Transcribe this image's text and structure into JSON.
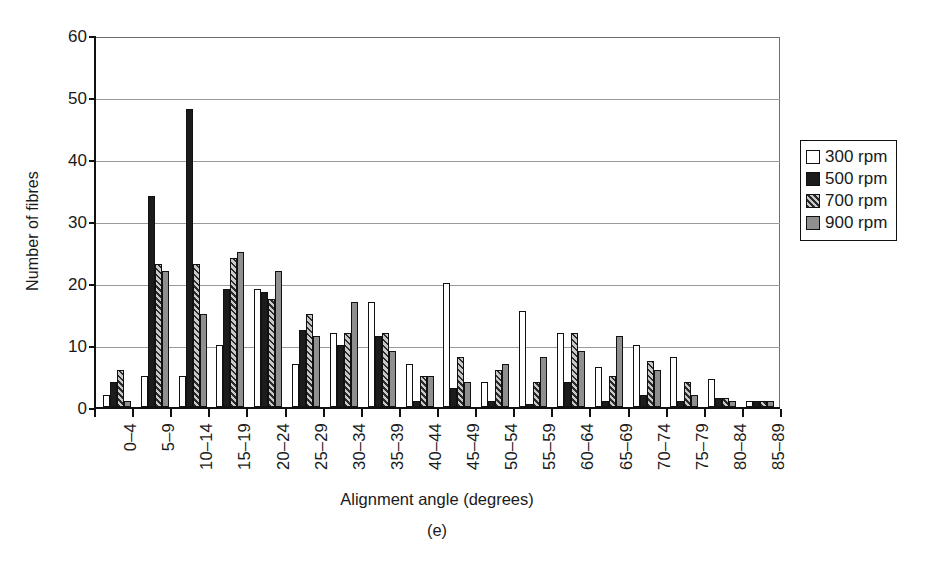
{
  "chart_data": {
    "type": "bar",
    "title": "",
    "panel_label": "(e)",
    "xlabel": "Alignment angle (degrees)",
    "ylabel": "Number of fibres",
    "ylim": [
      0,
      60
    ],
    "yticks": [
      0,
      10,
      20,
      30,
      40,
      50,
      60
    ],
    "grid": "horizontal",
    "legend_position": "right",
    "categories": [
      "0–4",
      "5–9",
      "10–14",
      "15–19",
      "20–24",
      "25–29",
      "30–34",
      "35–39",
      "40–44",
      "45–49",
      "50–54",
      "55–59",
      "60–64",
      "65–69",
      "70–74",
      "75–79",
      "80–84",
      "85–89"
    ],
    "series": [
      {
        "name": "300 rpm",
        "fill": "white",
        "color": "#ffffff",
        "values": [
          2,
          5,
          5,
          10,
          19,
          7,
          12,
          17,
          7,
          20,
          4,
          15.5,
          12,
          6.5,
          10,
          8,
          4.5,
          1
        ]
      },
      {
        "name": "500 rpm",
        "fill": "black",
        "color": "#1c1c1c",
        "values": [
          4,
          34,
          48,
          19,
          18.5,
          12.5,
          10,
          11.5,
          1,
          3,
          1,
          0.5,
          4,
          1,
          2,
          1,
          1.5,
          1
        ]
      },
      {
        "name": "700 rpm",
        "fill": "hatched",
        "color": "#c9c9c9",
        "values": [
          6,
          23,
          23,
          24,
          17.5,
          15,
          12,
          12,
          5,
          8,
          6,
          4,
          12,
          5,
          7.5,
          4,
          1.5,
          1
        ]
      },
      {
        "name": "900 rpm",
        "fill": "gray",
        "color": "#8f8f8f",
        "values": [
          1,
          22,
          15,
          25,
          22,
          11.5,
          17,
          9,
          5,
          4,
          7,
          8,
          9,
          11.5,
          6,
          2,
          1,
          1
        ]
      }
    ]
  },
  "legend": {
    "items": [
      {
        "label": "300 rpm"
      },
      {
        "label": "500 rpm"
      },
      {
        "label": "700 rpm"
      },
      {
        "label": "900 rpm"
      }
    ]
  }
}
